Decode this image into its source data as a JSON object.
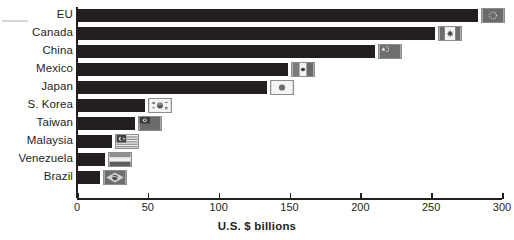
{
  "chart_data": {
    "type": "bar",
    "orientation": "horizontal",
    "title": "",
    "xlabel": "U.S. $ billions",
    "ylabel": "",
    "xlim": [
      0,
      300
    ],
    "xticks": [
      0,
      50,
      100,
      150,
      200,
      250,
      300
    ],
    "grid": false,
    "legend": null,
    "bar_color": "#231f20",
    "categories": [
      "EU",
      "Canada",
      "China",
      "Mexico",
      "Japan",
      "S. Korea",
      "Taiwan",
      "Malaysia",
      "Venezuela",
      "Brazil"
    ],
    "values": [
      283,
      253,
      210,
      149,
      134,
      48,
      41,
      25,
      20,
      16
    ],
    "points": [
      {
        "category": "EU",
        "value": 283,
        "flag": "eu-flag-icon"
      },
      {
        "category": "Canada",
        "value": 253,
        "flag": "canada-flag-icon"
      },
      {
        "category": "China",
        "value": 210,
        "flag": "china-flag-icon"
      },
      {
        "category": "Mexico",
        "value": 149,
        "flag": "mexico-flag-icon"
      },
      {
        "category": "Japan",
        "value": 134,
        "flag": "japan-flag-icon"
      },
      {
        "category": "S. Korea",
        "value": 48,
        "flag": "south-korea-flag-icon"
      },
      {
        "category": "Taiwan",
        "value": 41,
        "flag": "taiwan-flag-icon"
      },
      {
        "category": "Malaysia",
        "value": 25,
        "flag": "malaysia-flag-icon"
      },
      {
        "category": "Venezuela",
        "value": 20,
        "flag": "venezuela-flag-icon"
      },
      {
        "category": "Brazil",
        "value": 16,
        "flag": "brazil-flag-icon"
      }
    ]
  },
  "axis": {
    "title": "U.S. $ billions",
    "ticks": [
      {
        "label": "0",
        "value": 0
      },
      {
        "label": "50",
        "value": 50
      },
      {
        "label": "100",
        "value": 100
      },
      {
        "label": "150",
        "value": 150
      },
      {
        "label": "200",
        "value": 200
      },
      {
        "label": "250",
        "value": 250
      },
      {
        "label": "300",
        "value": 300
      }
    ]
  }
}
